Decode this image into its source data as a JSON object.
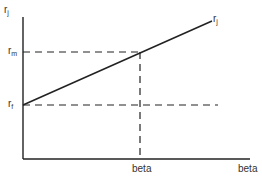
{
  "diagram": {
    "type": "security-market-line",
    "y_axis_label": "r",
    "y_axis_label_sub": "j",
    "line_label": "r",
    "line_label_sub": "j",
    "rm_label": "r",
    "rm_label_sub": "m",
    "rf_label": "r",
    "rf_label_sub": "f",
    "beta_tick_label": "beta",
    "x_axis_label": "beta",
    "colors": {
      "line": "#222222",
      "text": "#333333",
      "background": "#ffffff"
    }
  }
}
